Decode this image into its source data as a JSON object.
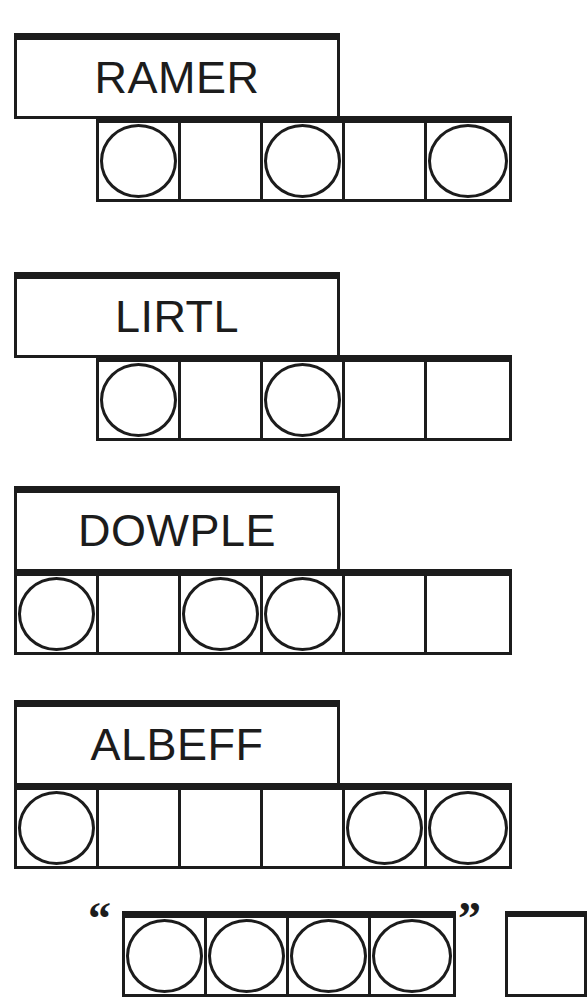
{
  "page": {
    "background_color": "#ffffff",
    "ink_color": "#1c1c1c",
    "width": 525,
    "height": 939
  },
  "legend": {
    "circle_symbol": "circle",
    "empty_symbol": "blank",
    "description": "Each word is printed in a banner box above a strip of square cells; some cells contain an outlined circle."
  },
  "groups": [
    {
      "word": "RAMER",
      "cell_count": 5,
      "cells": [
        {
          "circle": true
        },
        {
          "circle": false
        },
        {
          "circle": true
        },
        {
          "circle": false
        },
        {
          "circle": true
        }
      ],
      "box": {
        "left": 14,
        "top": 33,
        "width": 326,
        "height": 86
      },
      "row": {
        "left": 96,
        "top": 116,
        "cell_width": 82,
        "height": 86
      }
    },
    {
      "word": "LIRTL",
      "cell_count": 5,
      "cells": [
        {
          "circle": true
        },
        {
          "circle": false
        },
        {
          "circle": true
        },
        {
          "circle": false
        },
        {
          "circle": false
        }
      ],
      "box": {
        "left": 14,
        "top": 272,
        "width": 326,
        "height": 86
      },
      "row": {
        "left": 96,
        "top": 355,
        "cell_width": 82,
        "height": 86
      }
    },
    {
      "word": "DOWPLE",
      "cell_count": 6,
      "cells": [
        {
          "circle": true
        },
        {
          "circle": false
        },
        {
          "circle": true
        },
        {
          "circle": true
        },
        {
          "circle": false
        },
        {
          "circle": false
        }
      ],
      "box": {
        "left": 14,
        "top": 486,
        "width": 326,
        "height": 86
      },
      "row": {
        "left": 14,
        "top": 569,
        "cell_width": 82,
        "height": 86
      }
    },
    {
      "word": "ALBEFF",
      "cell_count": 6,
      "cells": [
        {
          "circle": true
        },
        {
          "circle": false
        },
        {
          "circle": false
        },
        {
          "circle": false
        },
        {
          "circle": true
        },
        {
          "circle": true
        }
      ],
      "box": {
        "left": 14,
        "top": 700,
        "width": 326,
        "height": 86
      },
      "row": {
        "left": 14,
        "top": 783,
        "cell_width": 82,
        "height": 86
      }
    }
  ],
  "quote_strip": {
    "open_quote": "“",
    "close_quote": "”",
    "cell_count": 4,
    "cells": [
      {
        "circle": true
      },
      {
        "circle": true
      },
      {
        "circle": true
      },
      {
        "circle": true
      }
    ],
    "clipped": true,
    "layout": {
      "open_quote_left": 88,
      "open_quote_top": 896,
      "row_left": 122,
      "row_top": 911,
      "cell_width": 82,
      "row_height": 86,
      "close_quote_left": 458,
      "close_quote_top": 896,
      "tail_left": 505,
      "tail_top": 911,
      "tail_width": 82,
      "tail_height": 86
    }
  }
}
